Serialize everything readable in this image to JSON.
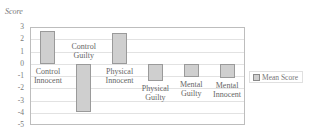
{
  "chart_data": {
    "type": "bar",
    "title": "",
    "xlabel": "",
    "ylabel": "Score",
    "ylim": [
      -5,
      3
    ],
    "yticks": [
      3,
      2,
      1,
      0,
      -1,
      -2,
      -3,
      -4,
      -5
    ],
    "grid": true,
    "legend_position": "right",
    "categories": [
      "Control Innocent",
      "Control Guilty",
      "Physical Innocent",
      "Physical Guilty",
      "Mental Guilty",
      "Mental Innocent"
    ],
    "category_labels": [
      "Control\nInnocent",
      "Control\nGuilty",
      "Physical\nInnocent",
      "Physical\nGuilty",
      "Mental\nGuilty",
      "Mental\nInnocent"
    ],
    "series": [
      {
        "name": "Mean Score",
        "values": [
          2.7,
          -3.9,
          2.5,
          -1.4,
          -1.1,
          -1.2
        ],
        "color": "#cfcfcf"
      }
    ]
  },
  "legend": {
    "label": "Mean Score"
  }
}
